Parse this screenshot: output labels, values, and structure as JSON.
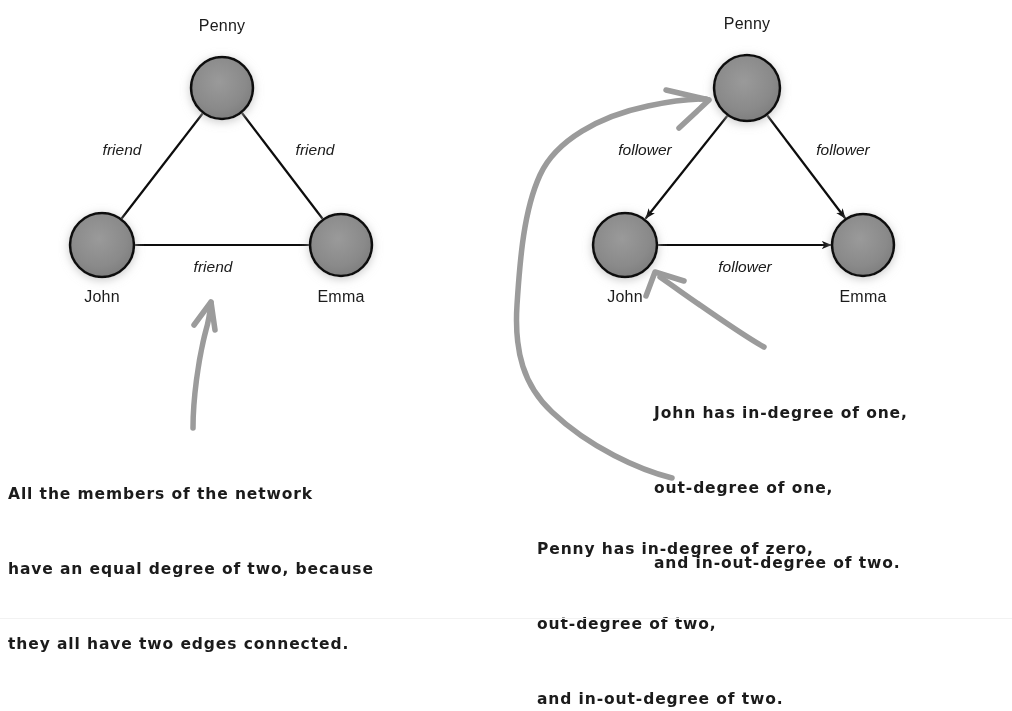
{
  "figure": {
    "background_color": "#ffffff",
    "node_fill_color": "#8a8a8a",
    "node_stroke_color": "#111111",
    "edge_color": "#111111",
    "pointer_color": "#9b9b9b",
    "text_color": "#1b1b1b"
  },
  "left_graph": {
    "title_note": "undirected friendship network",
    "type": "undirected",
    "nodes": [
      {
        "id": "penny",
        "label": "Penny",
        "cx": 222,
        "cy": 88,
        "r": 31
      },
      {
        "id": "john",
        "label": "John",
        "cx": 102,
        "cy": 245,
        "r": 32
      },
      {
        "id": "emma",
        "label": "Emma",
        "cx": 341,
        "cy": 245,
        "r": 31
      }
    ],
    "edges": [
      {
        "from": "penny",
        "to": "john",
        "label": "friend",
        "label_x": 122,
        "label_y": 155
      },
      {
        "from": "penny",
        "to": "emma",
        "label": "friend",
        "label_x": 315,
        "label_y": 155
      },
      {
        "from": "john",
        "to": "emma",
        "label": "friend",
        "label_x": 213,
        "label_y": 272
      }
    ],
    "degrees": {
      "penny": 2,
      "john": 2,
      "emma": 2
    }
  },
  "right_graph": {
    "title_note": "directed follower network",
    "type": "directed",
    "nodes": [
      {
        "id": "penny",
        "label": "Penny",
        "cx": 747,
        "cy": 88,
        "r": 33
      },
      {
        "id": "john",
        "label": "John",
        "cx": 625,
        "cy": 245,
        "r": 32
      },
      {
        "id": "emma",
        "label": "Emma",
        "cx": 863,
        "cy": 245,
        "r": 31
      }
    ],
    "edges": [
      {
        "from": "penny",
        "to": "john",
        "label": "follower",
        "label_x": 645,
        "label_y": 155,
        "directed": true
      },
      {
        "from": "penny",
        "to": "emma",
        "label": "follower",
        "label_x": 843,
        "label_y": 155,
        "directed": true
      },
      {
        "from": "john",
        "to": "emma",
        "label": "follower",
        "label_x": 745,
        "label_y": 272,
        "directed": true
      }
    ],
    "degrees": {
      "penny": {
        "in": 0,
        "out": 2,
        "in_out": 2
      },
      "john": {
        "in": 1,
        "out": 1,
        "in_out": 2
      },
      "emma": {
        "in": 2,
        "out": 0,
        "in_out": 2
      }
    }
  },
  "annotations": {
    "left_note": {
      "lines": [
        "All the members of the network",
        "have an equal degree of two, because",
        "they all have two edges connected."
      ],
      "x": 8,
      "y": 432,
      "points_to": "john-emma-friend-edge"
    },
    "john_note": {
      "lines": [
        "John has in-degree of one,",
        "out-degree of one,",
        "and in-out-degree of two."
      ],
      "x": 654,
      "y": 351,
      "points_to": "john-node"
    },
    "penny_note": {
      "lines": [
        "Penny has in-degree of zero,",
        "out-degree of two,",
        "and in-out-degree of two."
      ],
      "x": 537,
      "y": 487,
      "points_to": "penny-node"
    }
  }
}
